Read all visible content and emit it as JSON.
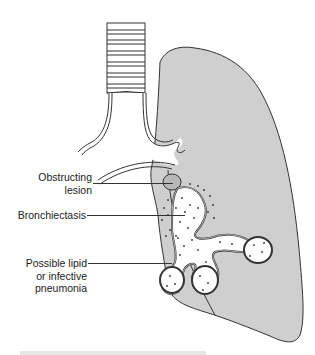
{
  "diagram": {
    "type": "anatomical illustration",
    "colors": {
      "lung_fill": "#cfcfcf",
      "outline": "#333333",
      "lesion_fill": "#b8b8b8",
      "airway_fill": "#ffffff"
    },
    "labels": [
      {
        "id": "obstructing-lesion",
        "text_line1": "Obstructing",
        "text_line2": "lesion"
      },
      {
        "id": "bronchiectasis",
        "text": "Bronchiectasis"
      },
      {
        "id": "pneumonia",
        "text_line1": "Possible lipid",
        "text_line2": "or infective",
        "text_line3": "pneumonia"
      }
    ]
  }
}
